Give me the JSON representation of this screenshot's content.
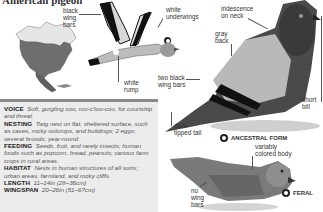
{
  "page": {
    "title": "American pigeon"
  },
  "map": {
    "region": "North America",
    "icon": "range-map"
  },
  "flying_bird": {
    "labels": {
      "black_wing_bars": "black\nwing\nbars",
      "white_underwings": "white\nunderwings",
      "white_rump": "white\nrump"
    }
  },
  "ancestral": {
    "labels": {
      "iridescence": "iridescence\non neck",
      "gray_back": "gray\nback",
      "two_black_wing_bars": "two black\nwing bars",
      "short_bill": "short\nbill",
      "dark_tipped_tail": "dark-\ntipped tail"
    },
    "form_label": "ANCESTRAL FORM",
    "form_icon": "map-marker-icon"
  },
  "feral": {
    "labels": {
      "variably_colored": "variably\ncolored body",
      "no_wing_bars": "no\nwing\nbars"
    },
    "form_label": "FERAL",
    "form_icon": "map-marker-icon"
  },
  "info": [
    {
      "key": "VOICE",
      "value": "Soft, gurgling coo, roo-c'too-coo, for courtship and threat."
    },
    {
      "key": "NESTING",
      "value": "Twig nest on flat, sheltered surface, such as caves, rocky outcrops, and buildings; 2 eggs; several broods; year-round."
    },
    {
      "key": "FEEDING",
      "value": "Seeds, fruit, and rarely insects; human foods such as popcorn, bread, peanuts; various farm crops in rural areas."
    },
    {
      "key": "HABITAT",
      "value": "Nests in human structures of all sorts; urban areas, farmland, and rocky cliffs."
    },
    {
      "key": "LENGTH",
      "value": "11–14in (28–36cm)"
    },
    {
      "key": "WINGSPAN",
      "value": "20–26in (51–67cm)"
    }
  ],
  "colors": {
    "accent_bar": "#8a8a8a",
    "text_box_bg": "#ececec"
  }
}
